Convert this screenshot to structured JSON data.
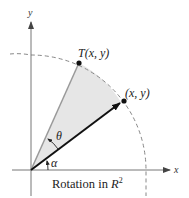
{
  "diagram": {
    "caption": {
      "text": "Rotation in ",
      "symbol": "R",
      "superscript": "2"
    },
    "axes": {
      "x_label": "x",
      "y_label": "y"
    },
    "points": [
      {
        "id": "original",
        "label": "(x, y)"
      },
      {
        "id": "rotated",
        "label_prefix": "T",
        "label_args": "(x, y)"
      }
    ],
    "angles": {
      "rotation": "θ",
      "initial": "α"
    },
    "colors": {
      "wedge_fill": "#e6e6e6",
      "rotated_vector": "#9a9a9a",
      "original_vector": "#111111",
      "axes": "#777777",
      "circle_dash": "#888888"
    }
  }
}
